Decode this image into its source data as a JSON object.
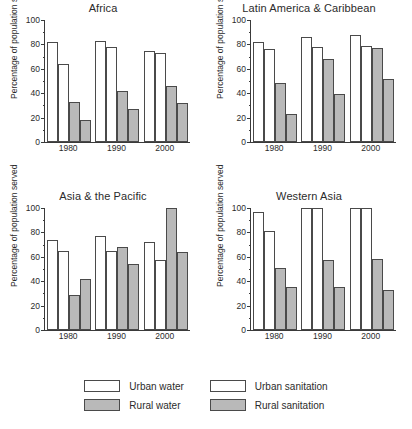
{
  "chart_data": {
    "type": "bar",
    "title": "",
    "categories": [
      "1980",
      "1990",
      "2000"
    ],
    "xlabel": "",
    "ylabel": "Percentage of population served",
    "ylim": [
      0,
      100
    ],
    "yticks": [
      0,
      20,
      40,
      60,
      80,
      100
    ],
    "minor_yticks": [
      10,
      30,
      50,
      70,
      90
    ],
    "grid": false,
    "legend_position": "bottom",
    "legend_entries": [
      "Urban water",
      "Rural water",
      "Urban sanitation",
      "Rural sanitation"
    ],
    "series_order": [
      "Urban water",
      "Urban sanitation",
      "Rural water",
      "Rural sanitation"
    ],
    "series_colors": {
      "Urban water": "#ffffff",
      "Urban sanitation": "#ffffff",
      "Rural water": "#b9b9b9",
      "Rural sanitation": "#b9b9b9"
    },
    "panels": [
      {
        "title": "Africa",
        "series": [
          {
            "name": "Urban water",
            "fill": "white",
            "values": [
              82,
              83,
              75
            ]
          },
          {
            "name": "Urban sanitation",
            "fill": "white",
            "values": [
              64,
              78,
              73
            ]
          },
          {
            "name": "Rural water",
            "fill": "grey",
            "values": [
              33,
              42,
              46
            ]
          },
          {
            "name": "Rural sanitation",
            "fill": "grey",
            "values": [
              18,
              27,
              32
            ]
          }
        ]
      },
      {
        "title": "Latin America & Caribbean",
        "series": [
          {
            "name": "Urban water",
            "fill": "white",
            "values": [
              82,
              86,
              88
            ]
          },
          {
            "name": "Urban sanitation",
            "fill": "white",
            "values": [
              76,
              78,
              79
            ]
          },
          {
            "name": "Rural water",
            "fill": "grey",
            "values": [
              48,
              68,
              77
            ]
          },
          {
            "name": "Rural sanitation",
            "fill": "grey",
            "values": [
              23,
              39,
              52
            ]
          }
        ]
      },
      {
        "title": "Asia & the Pacific",
        "series": [
          {
            "name": "Urban water",
            "fill": "white",
            "values": [
              74,
              77,
              72
            ]
          },
          {
            "name": "Urban sanitation",
            "fill": "white",
            "values": [
              65,
              65,
              57
            ]
          },
          {
            "name": "Rural water",
            "fill": "grey",
            "values": [
              29,
              68,
              100
            ]
          },
          {
            "name": "Rural sanitation",
            "fill": "grey",
            "values": [
              42,
              54,
              64
            ]
          }
        ]
      },
      {
        "title": "Western Asia",
        "series": [
          {
            "name": "Urban water",
            "fill": "white",
            "values": [
              97,
              100,
              100
            ]
          },
          {
            "name": "Urban sanitation",
            "fill": "white",
            "values": [
              81,
              100,
              100
            ]
          },
          {
            "name": "Rural water",
            "fill": "grey",
            "values": [
              51,
              57,
              58
            ]
          },
          {
            "name": "Rural sanitation",
            "fill": "grey",
            "values": [
              35,
              35,
              33
            ]
          }
        ]
      }
    ]
  },
  "legend": {
    "columns": [
      {
        "rows": [
          {
            "label": "Urban water",
            "fill": "white"
          },
          {
            "label": "Rural water",
            "fill": "grey"
          }
        ]
      },
      {
        "rows": [
          {
            "label": "Urban sanitation",
            "fill": "white"
          },
          {
            "label": "Rural sanitation",
            "fill": "grey"
          }
        ]
      }
    ]
  }
}
